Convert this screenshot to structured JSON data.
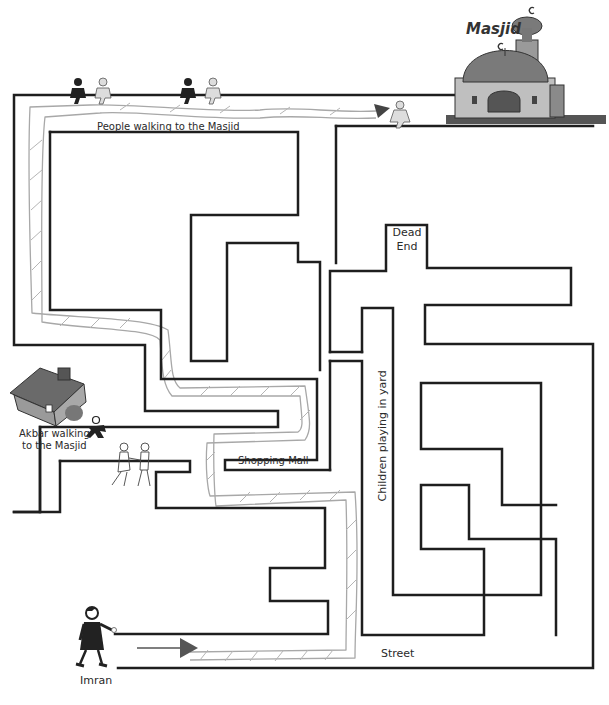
{
  "labels": {
    "masjid": "Masjid",
    "people_walking": "People walking to the Masjid",
    "dead_end_line1": "Dead",
    "dead_end_line2": "End",
    "akbar_line1": "Akbar walking",
    "akbar_line2": "to the Masjid",
    "shopping_mall": "Shopping Mall",
    "children_playing": "Children playing in yard",
    "street": "Street",
    "imran": "Imran"
  },
  "colors": {
    "wall": "#1e1e1e",
    "path_sketch": "#a8a8a8",
    "arrow": "#555555",
    "figure_dark": "#222222",
    "figure_light": "#dddddd",
    "mosque_dome": "#7a7a7a",
    "mosque_body": "#b9b9b9",
    "house_roof": "#6a6a6a",
    "house_body": "#9a9a9a"
  },
  "figures": [
    {
      "name": "walker-pair-1",
      "x": 80,
      "y": 82
    },
    {
      "name": "walker-pair-2",
      "x": 180,
      "y": 82
    },
    {
      "name": "walker-near-masjid",
      "x": 385,
      "y": 105
    },
    {
      "name": "akbar",
      "x": 93,
      "y": 418
    },
    {
      "name": "children",
      "x": 118,
      "y": 445
    },
    {
      "name": "imran",
      "x": 82,
      "y": 612
    }
  ]
}
